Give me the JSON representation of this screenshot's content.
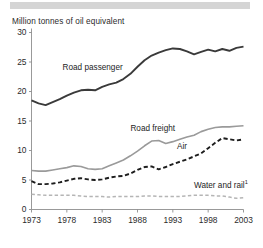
{
  "topbar": {
    "color": "#d5d5d5"
  },
  "chart_data": {
    "type": "line",
    "title": "",
    "ylabel": "Million tonnes of oil equivalent",
    "xlabel": "",
    "ylim": [
      0,
      30
    ],
    "xlim": [
      1973,
      2003
    ],
    "grid": false,
    "legend_position": "inline-annotations",
    "yticks": [
      0,
      5,
      10,
      15,
      20,
      25,
      30
    ],
    "ytick_labels": [
      "0",
      "5",
      "10",
      "15",
      "20",
      "25",
      "30"
    ],
    "xticks": [
      1973,
      1978,
      1983,
      1988,
      1993,
      1998,
      2003
    ],
    "xtick_labels": [
      "1973",
      "1978",
      "1983",
      "1988",
      "1993",
      "1998",
      "2003"
    ],
    "x": [
      1973,
      1974,
      1975,
      1976,
      1977,
      1978,
      1979,
      1980,
      1981,
      1982,
      1983,
      1984,
      1985,
      1986,
      1987,
      1988,
      1989,
      1990,
      1991,
      1992,
      1993,
      1994,
      1995,
      1996,
      1997,
      1998,
      1999,
      2000,
      2001,
      2002,
      2003
    ],
    "series": [
      {
        "name": "Road passenger",
        "color": "#3a3a3a",
        "style": "solid",
        "width": 1.9,
        "label": "Road passenger",
        "label_x": 1977.4,
        "label_y": 24.0,
        "values": [
          18.5,
          18.0,
          17.7,
          18.2,
          18.7,
          19.3,
          19.8,
          20.2,
          20.3,
          20.2,
          20.8,
          21.2,
          21.5,
          22.1,
          23.0,
          24.2,
          25.3,
          26.1,
          26.6,
          27.0,
          27.3,
          27.2,
          26.8,
          26.3,
          26.7,
          27.1,
          26.8,
          27.2,
          26.9,
          27.4,
          27.6
        ]
      },
      {
        "name": "Road freight",
        "color": "#9a9a9a",
        "style": "solid",
        "width": 1.6,
        "label": "Road freight",
        "label_x": 1987.0,
        "label_y": 13.6,
        "values": [
          6.6,
          6.5,
          6.5,
          6.7,
          6.9,
          7.1,
          7.4,
          7.3,
          6.9,
          6.8,
          6.9,
          7.4,
          7.9,
          8.4,
          9.1,
          9.9,
          10.8,
          11.6,
          11.7,
          11.2,
          11.5,
          11.9,
          12.3,
          12.6,
          13.2,
          13.6,
          13.9,
          14.0,
          14.0,
          14.1,
          14.2
        ]
      },
      {
        "name": "Air",
        "color": "#1d1d1d",
        "style": "dashed",
        "width": 1.9,
        "label": "Air",
        "label_x": 1993.6,
        "label_y": 10.6,
        "values": [
          4.8,
          4.3,
          4.3,
          4.4,
          4.6,
          4.9,
          5.2,
          5.3,
          5.1,
          5.0,
          5.1,
          5.4,
          5.6,
          5.7,
          6.1,
          6.7,
          7.2,
          7.3,
          6.8,
          7.2,
          7.7,
          8.1,
          8.5,
          9.0,
          9.5,
          10.4,
          11.3,
          12.1,
          11.9,
          11.7,
          11.9
        ]
      },
      {
        "name": "Water and rail",
        "color": "#b5b5b5",
        "style": "dashed",
        "width": 1.5,
        "label": "Water and rail",
        "label_footnote": "1",
        "label_x": 1996.0,
        "label_y": 4.3,
        "values": [
          2.6,
          2.5,
          2.4,
          2.4,
          2.4,
          2.4,
          2.4,
          2.3,
          2.2,
          2.2,
          2.2,
          2.1,
          2.2,
          2.2,
          2.2,
          2.2,
          2.3,
          2.3,
          2.2,
          2.2,
          2.2,
          2.2,
          2.3,
          2.4,
          2.4,
          2.4,
          2.3,
          2.3,
          2.1,
          1.9,
          2.0
        ]
      }
    ]
  }
}
